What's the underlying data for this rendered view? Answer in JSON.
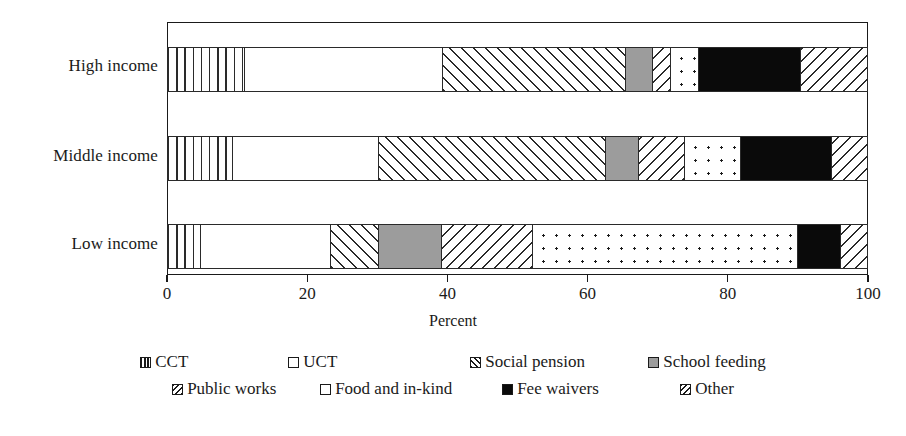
{
  "chart_data": {
    "type": "bar",
    "orientation": "horizontal",
    "stacked": true,
    "stack_total": 100,
    "title": "",
    "xlabel": "Percent",
    "ylabel": "",
    "xlim": [
      0,
      100
    ],
    "grid": false,
    "legend_position": "bottom",
    "xticks": [
      "0",
      "20",
      "40",
      "60",
      "80",
      "100"
    ],
    "xtick_values": [
      0,
      20,
      40,
      60,
      80,
      100
    ],
    "categories": [
      "High income",
      "Middle income",
      "Low income"
    ],
    "series": [
      {
        "name": "CCT",
        "pattern": "vertical-lines",
        "values": [
          11.0,
          9.3,
          4.7
        ]
      },
      {
        "name": "UCT",
        "pattern": "white",
        "values": [
          28.3,
          20.8,
          18.6
        ]
      },
      {
        "name": "Social pension",
        "pattern": "back-diagonal",
        "values": [
          26.0,
          32.4,
          6.8
        ]
      },
      {
        "name": "School feeding",
        "pattern": "solid-gray",
        "values": [
          3.9,
          4.7,
          9.0
        ]
      },
      {
        "name": "Public works",
        "pattern": "forward-diagonal",
        "values": [
          2.6,
          6.5,
          13.0
        ]
      },
      {
        "name": "Food and in-kind",
        "pattern": "dotted",
        "values": [
          3.9,
          8.0,
          37.8
        ]
      },
      {
        "name": "Fee waivers",
        "pattern": "solid-black",
        "values": [
          14.6,
          13.0,
          6.1
        ]
      },
      {
        "name": "Other",
        "pattern": "forward-diagonal",
        "values": [
          9.7,
          5.3,
          4.0
        ]
      }
    ],
    "colors": {
      "ink": "#1a1a1a",
      "school_feeding_gray": "#9c9c9c",
      "fee_waivers_black": "#0a0a0a",
      "background": "#ffffff"
    }
  },
  "legend": {
    "row1": [
      "CCT",
      "UCT",
      "Social pension",
      "School feeding"
    ],
    "row2": [
      "Public works",
      "Food and in-kind",
      "Fee waivers",
      "Other"
    ]
  }
}
